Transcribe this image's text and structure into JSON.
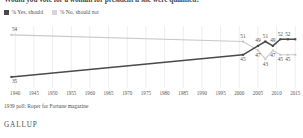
{
  "title": "Would you vote for a woman for president if she were qualified?",
  "legend": [
    {
      "label": "% Yes, should",
      "color": "#4a4a4a",
      "series": "yes"
    },
    {
      "label": "% No, should not",
      "color": "#cfcfcf",
      "series": "no"
    }
  ],
  "footnote": "1939 poll: Roper for Fortune magazine",
  "attribution": "GALLUP",
  "colors": {
    "yes_line": "#4a4a4a",
    "no_line": "#c9c9c9",
    "grid": "#e6e6e6",
    "text": "#4f4f4f",
    "background": "#ffffff"
  },
  "chart_data": {
    "type": "line",
    "title": "Would you vote for a woman for president if she were qualified?",
    "xlabel": "",
    "ylabel": "",
    "xlim": [
      1937,
      2016
    ],
    "ylim": [
      30,
      58
    ],
    "grid": true,
    "grid_axis": "x",
    "legend_position": "top-left",
    "xticks": [
      1940,
      1945,
      1950,
      1955,
      1960,
      1965,
      1970,
      1975,
      1980,
      1985,
      1990,
      1995,
      2000,
      2005,
      2010,
      2015
    ],
    "series": [
      {
        "name": "% Yes, should",
        "color": "#4a4a4a",
        "x": [
          1939,
          2001,
          2005,
          2007,
          2009,
          2011,
          2013,
          2015
        ],
        "values": [
          35,
          45,
          49,
          51,
          49,
          52,
          52,
          52
        ],
        "labels": [
          "35",
          "45",
          "49",
          "51",
          "49",
          "52",
          "52",
          ""
        ],
        "label_positions": [
          "below",
          "below",
          "above",
          "above",
          "above",
          "above",
          "above",
          ""
        ]
      },
      {
        "name": "% No, should not",
        "color": "#c9c9c9",
        "x": [
          1939,
          2001,
          2005,
          2007,
          2009,
          2011,
          2013,
          2015
        ],
        "values": [
          54,
          51,
          47,
          43,
          47,
          45,
          45,
          45
        ],
        "labels": [
          "54",
          "51",
          "47",
          "43",
          "47",
          "45",
          "45",
          ""
        ],
        "label_positions": [
          "above",
          "above",
          "below",
          "below",
          "below",
          "below",
          "below",
          ""
        ]
      }
    ],
    "annotations": [
      {
        "text": "54",
        "series": "no",
        "x": 1939,
        "y": 54
      },
      {
        "text": "35",
        "series": "yes",
        "x": 1939,
        "y": 35
      },
      {
        "text": "51",
        "series": "no",
        "x": 2001,
        "y": 51
      },
      {
        "text": "45",
        "series": "yes",
        "x": 2001,
        "y": 45
      },
      {
        "text": "49",
        "series": "yes",
        "x": 2005,
        "y": 49
      },
      {
        "text": "47",
        "series": "no",
        "x": 2005,
        "y": 47
      },
      {
        "text": "51",
        "series": "yes",
        "x": 2007,
        "y": 51
      },
      {
        "text": "43",
        "series": "no",
        "x": 2007,
        "y": 43
      },
      {
        "text": "49",
        "series": "yes",
        "x": 2009,
        "y": 49
      },
      {
        "text": "47",
        "series": "no",
        "x": 2009,
        "y": 47
      },
      {
        "text": "52",
        "series": "yes",
        "x": 2011,
        "y": 52
      },
      {
        "text": "45",
        "series": "no",
        "x": 2011,
        "y": 45
      },
      {
        "text": "52",
        "series": "yes",
        "x": 2013,
        "y": 52
      },
      {
        "text": "45",
        "series": "no",
        "x": 2013,
        "y": 45
      }
    ]
  }
}
